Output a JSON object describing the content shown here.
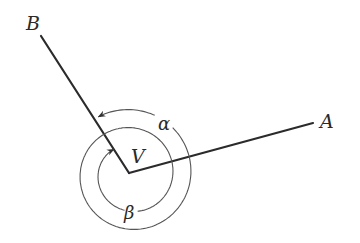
{
  "diagram": {
    "type": "angle-diagram",
    "vertex": {
      "label": "V",
      "x": 129,
      "y": 173
    },
    "points": [
      {
        "id": "A",
        "label": "A",
        "x": 313,
        "y": 123
      },
      {
        "id": "B",
        "label": "B",
        "x": 41,
        "y": 36
      }
    ],
    "angles": [
      {
        "label": "α",
        "name": "alpha",
        "direction": "counterclockwise from VA to VB (outer arc)"
      },
      {
        "label": "β",
        "name": "beta",
        "direction": "clockwise from VB around to VB side (inner arc)"
      }
    ],
    "spiral": {
      "center_x": 131,
      "center_y": 174,
      "start_radius": 66,
      "end_radius": 30,
      "start_angle_deg": -122.7,
      "sweep_deg": 720,
      "alpha_gap_deg": [
        -68,
        -48
      ],
      "beta_gap_deg": [
        440,
        460
      ]
    },
    "colors": {
      "ray": "#2b2b2b",
      "arc": "#555555",
      "text": "#2a2a2a",
      "background": "#ffffff"
    }
  }
}
